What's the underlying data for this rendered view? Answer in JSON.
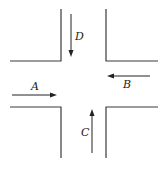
{
  "diagram": {
    "title": "",
    "type": "intersection",
    "colors": {
      "road_edge": "#3a3a3a",
      "arrow": "#222222",
      "background": "#ffffff"
    },
    "vehicles": [
      {
        "id": "A",
        "label": "A",
        "direction": "east"
      },
      {
        "id": "B",
        "label": "B",
        "direction": "west"
      },
      {
        "id": "C",
        "label": "C",
        "direction": "north"
      },
      {
        "id": "D",
        "label": "D",
        "direction": "south"
      }
    ]
  }
}
